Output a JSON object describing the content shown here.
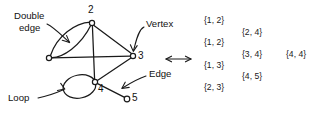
{
  "figure": {
    "ink_color": "#1a1a1a",
    "background": "#ffffff"
  },
  "graph": {
    "vertices": [
      {
        "id": "v1",
        "label": "",
        "cx": 49,
        "cy": 58
      },
      {
        "id": "v2",
        "label": "2",
        "cx": 92,
        "cy": 23
      },
      {
        "id": "v3",
        "label": "3",
        "cx": 133,
        "cy": 56
      },
      {
        "id": "v4",
        "label": "4",
        "cx": 95,
        "cy": 82
      },
      {
        "id": "v5",
        "label": "5",
        "cx": 127,
        "cy": 99
      }
    ],
    "vertex_labels": [
      {
        "text": "2",
        "x": 88,
        "y": 7
      },
      {
        "text": "3",
        "x": 139,
        "y": 50
      },
      {
        "text": "4",
        "x": 99,
        "y": 84
      },
      {
        "text": "5",
        "x": 133,
        "y": 93
      }
    ],
    "edges": [
      {
        "from": "v1",
        "to": "v2",
        "kind": "curve-upper"
      },
      {
        "from": "v1",
        "to": "v2",
        "kind": "curve-lower"
      },
      {
        "from": "v1",
        "to": "v3",
        "kind": "straight"
      },
      {
        "from": "v2",
        "to": "v3",
        "kind": "straight"
      },
      {
        "from": "v2",
        "to": "v4",
        "kind": "straight"
      },
      {
        "from": "v3",
        "to": "v4",
        "kind": "straight"
      },
      {
        "from": "v4",
        "to": "v4",
        "kind": "loop"
      },
      {
        "from": "v4",
        "to": "v5",
        "kind": "straight"
      }
    ]
  },
  "callouts": [
    {
      "name": "double-edge",
      "line1": "Double",
      "line2": "edge",
      "x": 12,
      "y": 12
    },
    {
      "name": "vertex",
      "text": "Vertex",
      "x": 146,
      "y": 24
    },
    {
      "name": "edge",
      "text": "Edge",
      "x": 148,
      "y": 73
    },
    {
      "name": "loop",
      "text": "Loop",
      "x": 10,
      "y": 94
    }
  ],
  "equivalence": {
    "symbol": "↔",
    "x": 164,
    "y": 52
  },
  "sets": {
    "column_1": [
      {
        "text": "{1, 2}",
        "x": 204,
        "y": 20
      },
      {
        "text": "{1, 2}",
        "x": 204,
        "y": 42
      },
      {
        "text": "{1, 3}",
        "x": 204,
        "y": 65
      },
      {
        "text": "{2, 3}",
        "x": 204,
        "y": 87
      }
    ],
    "column_2": [
      {
        "text": "{2, 4}",
        "x": 242,
        "y": 32
      },
      {
        "text": "{3, 4}",
        "x": 242,
        "y": 54
      },
      {
        "text": "{4, 5}",
        "x": 242,
        "y": 76
      }
    ],
    "column_3": [
      {
        "text": "{4, 4}",
        "x": 287,
        "y": 54
      }
    ]
  }
}
